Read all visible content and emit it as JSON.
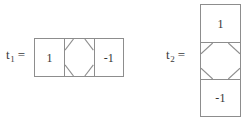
{
  "figure": {
    "background_color": "#ffffff",
    "line_color": "#8d8d8d",
    "text_color": "#333333"
  },
  "tiles": [
    {
      "id": "t1",
      "label": {
        "symbol": "t",
        "subscript": "1",
        "equals": "="
      },
      "orientation": "horizontal",
      "cells": [
        {
          "kind": "value",
          "value": "1"
        },
        {
          "kind": "octagon",
          "value": ""
        },
        {
          "kind": "value",
          "value": "-1"
        }
      ]
    },
    {
      "id": "t2",
      "label": {
        "symbol": "t",
        "subscript": "2",
        "equals": "="
      },
      "orientation": "vertical",
      "cells": [
        {
          "kind": "value",
          "value": "1"
        },
        {
          "kind": "octagon",
          "value": ""
        },
        {
          "kind": "value",
          "value": "-1"
        }
      ]
    }
  ]
}
